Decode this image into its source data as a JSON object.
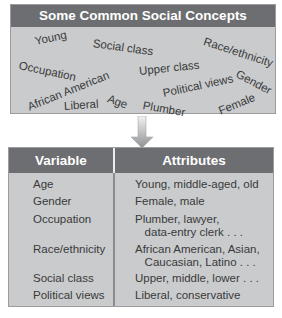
{
  "concepts_panel": {
    "title": "Some Common Social Concepts",
    "words": [
      "Young",
      "Social class",
      "Race/ethnicity",
      "Occupation",
      "Upper class",
      "Gender",
      "African American",
      "Political views",
      "Age",
      "Liberal",
      "Plumber",
      "Female"
    ]
  },
  "arrow": {
    "icon": "down-arrow-icon"
  },
  "table": {
    "headers": {
      "variable": "Variable",
      "attributes": "Attributes"
    },
    "rows": [
      {
        "variable": "Age",
        "attributes": "Young, middle-aged, old"
      },
      {
        "variable": "Gender",
        "attributes": "Female, male"
      },
      {
        "variable": "Occupation",
        "attributes": "Plumber, lawyer,\n   data-entry clerk . . ."
      },
      {
        "variable": "Race/ethnicity",
        "attributes": "African American, Asian,\n   Caucasian, Latino . . ."
      },
      {
        "variable": "Social class",
        "attributes": "Upper, middle, lower . . ."
      },
      {
        "variable": "Political views",
        "attributes": "Liberal, conservative"
      }
    ]
  },
  "colors": {
    "header_bg": "#6c6e71",
    "panel_bg": "#c9cbcd",
    "text": "#3a3a3a"
  }
}
